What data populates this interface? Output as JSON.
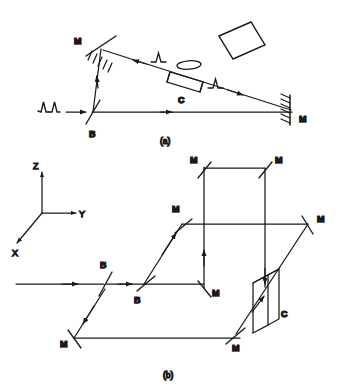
{
  "figure": {
    "stroke_color": "#1a1a1a",
    "background_color": "#ffffff"
  },
  "panel_a": {
    "caption": "(a)",
    "labels": {
      "mirror_top_left": "M",
      "mirror_right": "M",
      "beamsplitter": "B",
      "cell": "C"
    },
    "components": [
      {
        "name": "input-pulse-train",
        "label": "",
        "kind": "pulse-pair"
      },
      {
        "name": "beamsplitter-b",
        "label": "B",
        "kind": "beamsplitter"
      },
      {
        "name": "mirror-top-left",
        "label": "M",
        "kind": "hatched-mirror"
      },
      {
        "name": "mirror-right",
        "label": "M",
        "kind": "hatched-mirror"
      },
      {
        "name": "sample-cell-c",
        "label": "C",
        "kind": "cell"
      },
      {
        "name": "lens",
        "label": "",
        "kind": "ellipse-lens"
      },
      {
        "name": "detector-screen",
        "label": "",
        "kind": "tilted-square"
      },
      {
        "name": "counter-pulse-1",
        "label": "",
        "kind": "pulse-single"
      },
      {
        "name": "counter-pulse-2",
        "label": "",
        "kind": "pulse-single"
      }
    ]
  },
  "panel_b": {
    "caption": "(b)",
    "axes": {
      "z": "Z",
      "y": "Y",
      "x": "X"
    },
    "labels": {
      "beamsplitter_1": "B",
      "beamsplitter_2": "B",
      "mirror_upper_left": "M",
      "mirror_upper_right": "M",
      "mirror_mid_left": "M",
      "mirror_mid_right": "M",
      "mirror_lower_mid": "M",
      "mirror_bottom_left": "M",
      "mirror_bottom_right": "M",
      "cell": "C"
    },
    "components": [
      {
        "name": "beamsplitter-b1",
        "label": "B",
        "kind": "beamsplitter"
      },
      {
        "name": "beamsplitter-b2",
        "label": "B",
        "kind": "beamsplitter"
      },
      {
        "name": "mirror-upper-left",
        "label": "M",
        "kind": "mirror"
      },
      {
        "name": "mirror-upper-right",
        "label": "M",
        "kind": "mirror"
      },
      {
        "name": "mirror-mid-left",
        "label": "M",
        "kind": "mirror"
      },
      {
        "name": "mirror-mid-right",
        "label": "M",
        "kind": "mirror"
      },
      {
        "name": "mirror-lower-mid",
        "label": "M",
        "kind": "mirror"
      },
      {
        "name": "mirror-bottom-left",
        "label": "M",
        "kind": "mirror"
      },
      {
        "name": "mirror-bottom-right",
        "label": "M",
        "kind": "mirror"
      },
      {
        "name": "sample-cell-c",
        "label": "C",
        "kind": "slab-3d"
      }
    ]
  }
}
